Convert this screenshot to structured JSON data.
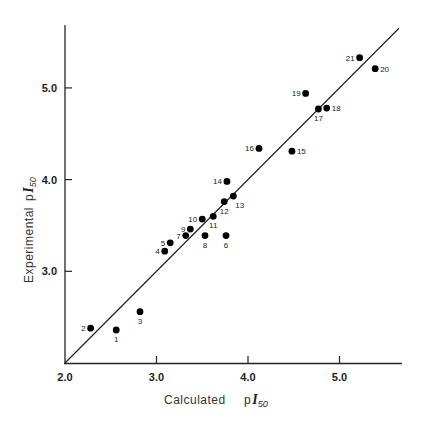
{
  "chart_data": {
    "type": "scatter",
    "title": "",
    "xlabel": "Calculated pI50",
    "ylabel": "Experimental pI50",
    "xlabel_text": "Calculated",
    "ylabel_text": "Experimental",
    "axis_symbol_prefix": "p",
    "axis_symbol": "I",
    "axis_symbol_sub": "50",
    "xlim": [
      2.0,
      5.7
    ],
    "ylim": [
      2.0,
      5.65
    ],
    "x_ticks": [
      2.0,
      3.0,
      4.0,
      5.0
    ],
    "y_ticks": [
      3.0,
      4.0,
      5.0
    ],
    "x_tick_labels": [
      "2.0",
      "3.0",
      "4.0",
      "5.0"
    ],
    "y_tick_labels": [
      "3.0",
      "4.0",
      "5.0"
    ],
    "grid": false,
    "legend": null,
    "reference_line": {
      "type": "identity",
      "x": [
        2.0,
        5.65
      ],
      "y": [
        2.0,
        5.65
      ],
      "label": "y = x"
    },
    "points": [
      {
        "label": "1",
        "x": 2.56,
        "y": 2.36,
        "label_pos": "below"
      },
      {
        "label": "2",
        "x": 2.28,
        "y": 2.38,
        "label_pos": "left"
      },
      {
        "label": "3",
        "x": 2.82,
        "y": 2.56,
        "label_pos": "below"
      },
      {
        "label": "4",
        "x": 3.09,
        "y": 3.22,
        "label_pos": "left"
      },
      {
        "label": "5",
        "x": 3.15,
        "y": 3.31,
        "label_pos": "left"
      },
      {
        "label": "6",
        "x": 3.76,
        "y": 3.39,
        "label_pos": "below"
      },
      {
        "label": "7",
        "x": 3.32,
        "y": 3.39,
        "label_pos": "left"
      },
      {
        "label": "8",
        "x": 3.53,
        "y": 3.39,
        "label_pos": "below"
      },
      {
        "label": "9",
        "x": 3.37,
        "y": 3.46,
        "label_pos": "left"
      },
      {
        "label": "10",
        "x": 3.5,
        "y": 3.57,
        "label_pos": "left"
      },
      {
        "label": "11",
        "x": 3.62,
        "y": 3.6,
        "label_pos": "below"
      },
      {
        "label": "12",
        "x": 3.74,
        "y": 3.76,
        "label_pos": "below"
      },
      {
        "label": "13",
        "x": 3.84,
        "y": 3.82,
        "label_pos": "below-right"
      },
      {
        "label": "14",
        "x": 3.77,
        "y": 3.98,
        "label_pos": "left"
      },
      {
        "label": "15",
        "x": 4.48,
        "y": 4.31,
        "label_pos": "right"
      },
      {
        "label": "16",
        "x": 4.12,
        "y": 4.34,
        "label_pos": "left"
      },
      {
        "label": "17",
        "x": 4.77,
        "y": 4.77,
        "label_pos": "below"
      },
      {
        "label": "18",
        "x": 4.86,
        "y": 4.78,
        "label_pos": "right"
      },
      {
        "label": "19",
        "x": 4.63,
        "y": 4.94,
        "label_pos": "left"
      },
      {
        "label": "20",
        "x": 5.39,
        "y": 5.21,
        "label_pos": "right"
      },
      {
        "label": "21",
        "x": 5.22,
        "y": 5.33,
        "label_pos": "left"
      }
    ],
    "colors": {
      "points": "#000000",
      "axes": "#222222",
      "line": "#222222"
    }
  }
}
